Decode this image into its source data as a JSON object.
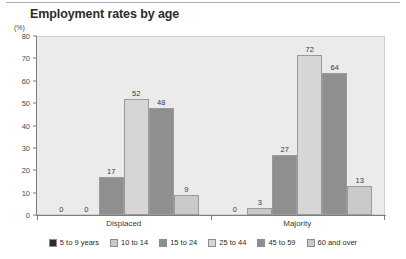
{
  "chart_data": {
    "type": "bar",
    "title": "Employment rates by age",
    "xlabel": "",
    "ylabel": "(%)",
    "ylim": [
      0,
      80
    ],
    "ytick_labels": [
      "0",
      "10",
      "20",
      "30",
      "40",
      "50",
      "60",
      "70",
      "80"
    ],
    "ytick_values": [
      0,
      10,
      20,
      30,
      40,
      50,
      60,
      70,
      80
    ],
    "grid": false,
    "legend_position": "bottom",
    "categories": [
      "Displaced",
      "Majority"
    ],
    "series": [
      {
        "name": "5 to 9 years",
        "color": "#2b2b2b",
        "values": [
          0,
          0
        ]
      },
      {
        "name": "10 to 14",
        "color": "#c9c9c9",
        "values": [
          0,
          3
        ]
      },
      {
        "name": "15 to 24",
        "color": "#8f8f8f",
        "values": [
          17,
          27
        ]
      },
      {
        "name": "25 to 44",
        "color": "#d6d6d6",
        "values": [
          52,
          72
        ]
      },
      {
        "name": "45 to 59",
        "color": "#8f8f8f",
        "values": [
          48,
          64
        ]
      },
      {
        "name": "60 and over",
        "color": "#c9c9c9",
        "values": [
          9,
          13
        ]
      }
    ],
    "bar_labels": {
      "Displaced": [
        "0",
        "0",
        "17",
        "52",
        "48",
        "9"
      ],
      "Majority": [
        "0",
        "3",
        "27",
        "72",
        "64",
        "13"
      ]
    },
    "plot_background": "#ebebeb",
    "axis_color": "#7d7d7d"
  },
  "legend": {
    "items": [
      {
        "label": "5 to 9 years"
      },
      {
        "label": "10 to 14"
      },
      {
        "label": "15 to 24"
      },
      {
        "label": "25 to 44"
      },
      {
        "label": "45 to 59"
      },
      {
        "label": "60 and over"
      }
    ]
  },
  "axis": {
    "unit": "(%)",
    "ticks": [
      "80",
      "70",
      "60",
      "50",
      "40",
      "30",
      "20",
      "10",
      "0"
    ]
  },
  "groups": [
    {
      "label": "Displaced"
    },
    {
      "label": "Majority"
    }
  ]
}
